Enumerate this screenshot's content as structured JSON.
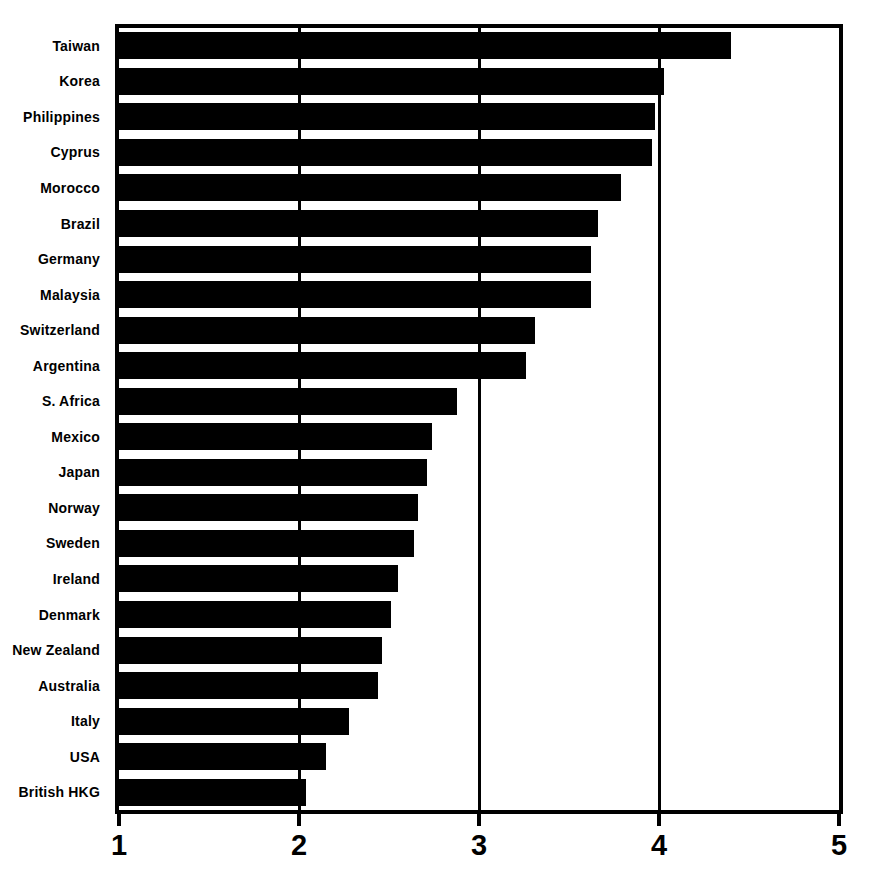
{
  "chart_data": {
    "type": "bar",
    "orientation": "horizontal",
    "categories": [
      "Taiwan",
      "Korea",
      "Philippines",
      "Cyprus",
      "Morocco",
      "Brazil",
      "Germany",
      "Malaysia",
      "Switzerland",
      "Argentina",
      "S. Africa",
      "Mexico",
      "Japan",
      "Norway",
      "Sweden",
      "Ireland",
      "Denmark",
      "New Zealand",
      "Australia",
      "Italy",
      "USA",
      "British HKG"
    ],
    "values": [
      4.4,
      4.03,
      3.98,
      3.96,
      3.79,
      3.66,
      3.62,
      3.62,
      3.31,
      3.26,
      2.88,
      2.74,
      2.71,
      2.66,
      2.64,
      2.55,
      2.51,
      2.46,
      2.44,
      2.28,
      2.15,
      2.04
    ],
    "xlim": [
      1,
      5
    ],
    "x_ticks": [
      "1",
      "2",
      "3",
      "4",
      "5"
    ],
    "grid": true,
    "gridline_ticks": [
      2,
      3,
      4
    ],
    "legend": "none",
    "bar_color": "#000000",
    "background_color": "#ffffff",
    "border_color": "#000000"
  }
}
